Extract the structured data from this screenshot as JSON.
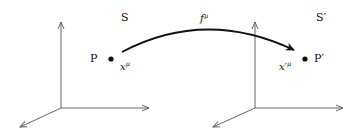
{
  "diagram": {
    "type": "coordinate-transformation",
    "frames": [
      {
        "id": "S",
        "label": "S",
        "point_label": "P",
        "coord_label_base": "x",
        "coord_label_sup": "μ"
      },
      {
        "id": "S_prime",
        "label": "S′",
        "point_label": "P′",
        "coord_label_base": "x′",
        "coord_label_sup": "μ"
      }
    ],
    "mapping": {
      "label_base": "f",
      "label_sup": "μ",
      "from": "P",
      "to": "P′"
    }
  },
  "colors": {
    "axis": "#555555",
    "arrow": "#111111",
    "text": "#111111"
  }
}
